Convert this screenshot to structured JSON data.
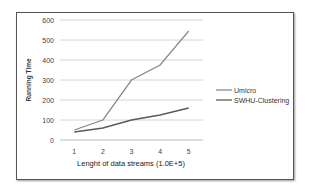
{
  "chart_data": {
    "type": "line",
    "title": "",
    "xlabel": "Lenght of data streams (1.0E+5)",
    "ylabel": "Running Time",
    "categories": [
      "1",
      "2",
      "3",
      "4",
      "5"
    ],
    "yticks": [
      "0",
      "100",
      "200",
      "300",
      "400",
      "500",
      "600"
    ],
    "ylim": [
      0,
      600
    ],
    "grid": true,
    "legend_position": "right",
    "series": [
      {
        "name": "Umicro",
        "values": [
          50,
          100,
          300,
          375,
          545
        ],
        "color": "#8a8a8a"
      },
      {
        "name": "SWHU-Clustering",
        "values": [
          40,
          60,
          100,
          125,
          160
        ],
        "color": "#5a5a5a"
      }
    ]
  }
}
